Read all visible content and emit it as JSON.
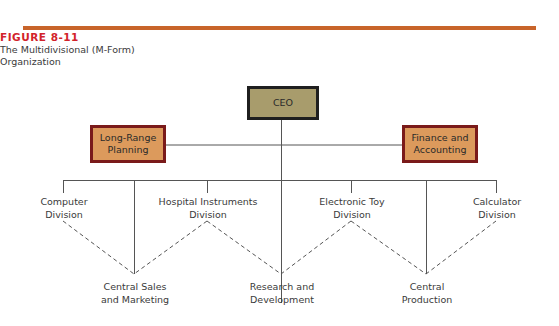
{
  "figure": {
    "number": "FIGURE 8-11",
    "caption_line1": "The Multidivisional (M-Form)",
    "caption_line2": "Organization",
    "accent_bar_color": "#c8642a",
    "number_color": "#d2232a"
  },
  "chart": {
    "top": {
      "label": "CEO",
      "fill": "#a89c6c",
      "border": "#1f1f1f"
    },
    "staff": [
      {
        "label_line1": "Long-Range",
        "label_line2": "Planning",
        "fill": "#dc9a5c",
        "border": "#7a1a1a"
      },
      {
        "label_line1": "Finance and",
        "label_line2": "Accounting",
        "fill": "#dc9a5c",
        "border": "#7a1a1a"
      }
    ],
    "divisions": [
      {
        "line1": "Computer",
        "line2": "Division"
      },
      {
        "line1": "Hospital Instruments",
        "line2": "Division"
      },
      {
        "line1": "Electronic Toy",
        "line2": "Division"
      },
      {
        "line1": "Calculator",
        "line2": "Division"
      }
    ],
    "central_functions": [
      {
        "line1": "Central Sales",
        "line2": "and Marketing"
      },
      {
        "line1": "Research and",
        "line2": "Development"
      },
      {
        "line1": "Central",
        "line2": "Production"
      }
    ]
  }
}
